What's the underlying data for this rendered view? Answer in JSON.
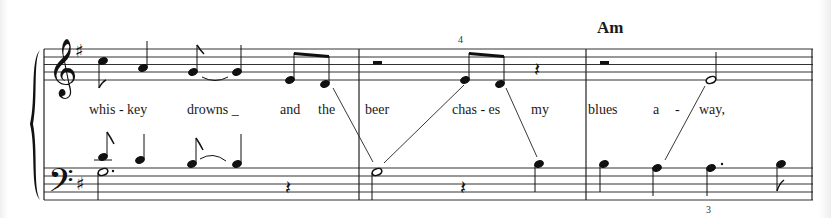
{
  "score": {
    "key_signature": "G major (1 sharp)",
    "chord_symbols": [
      {
        "label": "Am",
        "x": 597,
        "y": 20
      }
    ],
    "fingerings": [
      {
        "label": "4",
        "x": 458,
        "y": 36
      },
      {
        "label": "3",
        "x": 706,
        "y": 204
      }
    ],
    "lyrics": [
      {
        "text": "whis - key",
        "x": 89
      },
      {
        "text": "drowns _",
        "x": 187
      },
      {
        "text": "and",
        "x": 280
      },
      {
        "text": "the",
        "x": 318
      },
      {
        "text": "beer",
        "x": 365
      },
      {
        "text": "chas - es",
        "x": 452
      },
      {
        "text": "my",
        "x": 531
      },
      {
        "text": "blues",
        "x": 588
      },
      {
        "text": "a",
        "x": 653
      },
      {
        "text": "-",
        "x": 675
      },
      {
        "text": "way,",
        "x": 699
      }
    ],
    "measures": [
      {
        "number": 1,
        "treble": "B8 A4 G8~G4 E8 D8",
        "bass": "B8 C4 B8~B4 / G2. rest4"
      },
      {
        "number": 2,
        "treble": "rest2 E8 D8 rest4",
        "bass": "G2 rest4 B4"
      },
      {
        "number": 3,
        "treble": "rest2 E2",
        "bass": "B4 A4 A4. B8"
      }
    ]
  }
}
